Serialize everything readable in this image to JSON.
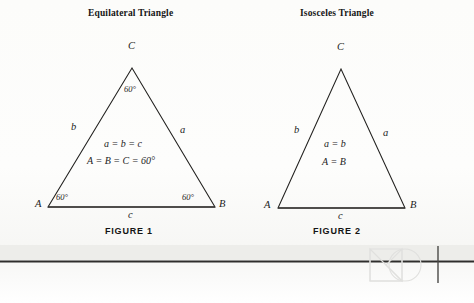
{
  "page": {
    "background_color": "#fdfdfc",
    "ink_color": "#1c1c1c"
  },
  "figure1": {
    "title": "Equilateral Triangle",
    "caption": "FIGURE  1",
    "vertices": {
      "A": "A",
      "B": "B",
      "C": "C"
    },
    "sides": {
      "left": "b",
      "right": "a",
      "base": "c"
    },
    "angles": {
      "at_A": "60°",
      "at_B": "60°",
      "at_C": "60°"
    },
    "relations": [
      "a = b = c",
      "A = B = C = 60°"
    ]
  },
  "figure2": {
    "title": "Isosceles Triangle",
    "caption": "FIGURE  2",
    "vertices": {
      "A": "A",
      "B": "B",
      "C": "C"
    },
    "sides": {
      "left": "b",
      "right": "a",
      "base": "c"
    },
    "relations": [
      "a = b",
      "A = B"
    ]
  },
  "watermark": {
    "shapes": "square-circle-triangle-logo",
    "color": "#e2e2e2"
  }
}
